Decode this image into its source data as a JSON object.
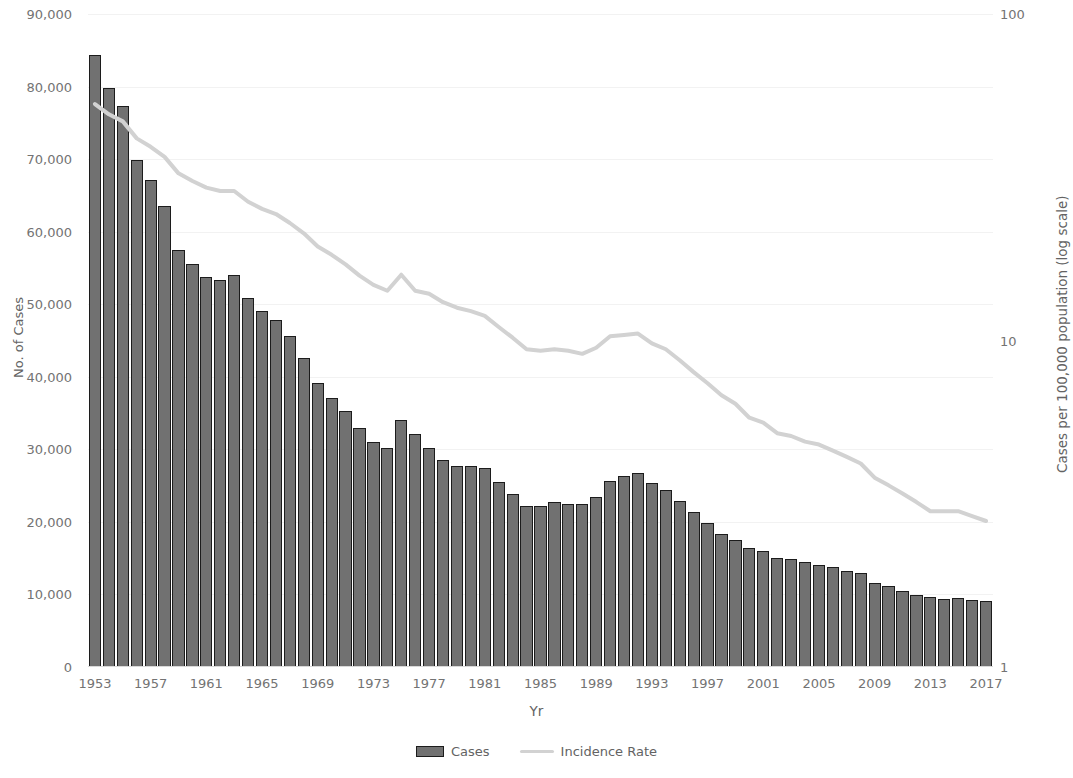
{
  "chart_data": {
    "type": "bar",
    "title": "",
    "xlabel": "Yr",
    "ylabel": "No. of Cases",
    "y2label": "Cases per 100,000 population (log scale)",
    "ylim": [
      0,
      90000
    ],
    "y2lim": [
      1,
      100
    ],
    "y2_scale": "log",
    "grid": true,
    "legend_position": "bottom",
    "y_ticks": [
      "90,000",
      "80,000",
      "70,000",
      "60,000",
      "50,000",
      "40,000",
      "30,000",
      "20,000",
      "10,000",
      "0"
    ],
    "y_tick_values": [
      90000,
      80000,
      70000,
      60000,
      50000,
      40000,
      30000,
      20000,
      10000,
      0
    ],
    "y2_ticks": [
      "100",
      "10",
      "1"
    ],
    "y2_tick_values": [
      100,
      10,
      1
    ],
    "x_tick_labels": [
      "1953",
      "1957",
      "1961",
      "1965",
      "1969",
      "1973",
      "1977",
      "1981",
      "1985",
      "1989",
      "1993",
      "1997",
      "2001",
      "2005",
      "2009",
      "2013",
      "2017"
    ],
    "categories": [
      1953,
      1954,
      1955,
      1956,
      1957,
      1958,
      1959,
      1960,
      1961,
      1962,
      1963,
      1964,
      1965,
      1966,
      1967,
      1968,
      1969,
      1970,
      1971,
      1972,
      1973,
      1974,
      1975,
      1976,
      1977,
      1978,
      1979,
      1980,
      1981,
      1982,
      1983,
      1984,
      1985,
      1986,
      1987,
      1988,
      1989,
      1990,
      1991,
      1992,
      1993,
      1994,
      1995,
      1996,
      1997,
      1998,
      1999,
      2000,
      2001,
      2002,
      2003,
      2004,
      2005,
      2006,
      2007,
      2008,
      2009,
      2010,
      2011,
      2012,
      2013,
      2014,
      2015,
      2016,
      2017
    ],
    "series": [
      {
        "name": "Cases",
        "axis": "left",
        "type": "bar",
        "color": "#717171",
        "values": [
          84304,
          79775,
          77368,
          69895,
          67149,
          63534,
          57535,
          55494,
          53726,
          53315,
          54042,
          50874,
          49016,
          47767,
          45647,
          42623,
          39120,
          37137,
          35217,
          32882,
          30998,
          30122,
          33989,
          32105,
          30145,
          28521,
          27669,
          27749,
          27373,
          25520,
          23846,
          22255,
          22201,
          22768,
          22517,
          22436,
          23495,
          25701,
          26283,
          26673,
          25313,
          24361,
          22860,
          21337,
          19851,
          18361,
          17531,
          16377,
          15989,
          15075,
          14874,
          14517,
          14093,
          13767,
          13299,
          12904,
          11545,
          11182,
          10521,
          9951,
          9582,
          9421,
          9557,
          9272,
          9093
        ]
      },
      {
        "name": "Incidence Rate",
        "axis": "right",
        "type": "line",
        "color": "#d2d2d2",
        "values": [
          53.0,
          49.3,
          46.9,
          41.6,
          39.2,
          36.5,
          32.5,
          30.8,
          29.4,
          28.7,
          28.7,
          26.6,
          25.3,
          24.4,
          22.9,
          21.3,
          19.4,
          18.3,
          17.1,
          15.8,
          14.8,
          14.2,
          15.9,
          14.2,
          13.9,
          13.1,
          12.6,
          12.3,
          11.9,
          11.0,
          10.2,
          9.4,
          9.3,
          9.4,
          9.3,
          9.1,
          9.5,
          10.3,
          10.4,
          10.5,
          9.8,
          9.4,
          8.7,
          8.0,
          7.4,
          6.8,
          6.4,
          5.8,
          5.6,
          5.2,
          5.1,
          4.9,
          4.8,
          4.6,
          4.4,
          4.2,
          3.8,
          3.6,
          3.4,
          3.2,
          3.0,
          3.0,
          3.0,
          2.9,
          2.8
        ]
      }
    ]
  },
  "legend": {
    "items": [
      {
        "label": "Cases",
        "marker": "bar-swatch"
      },
      {
        "label": "Incidence Rate",
        "marker": "line-swatch"
      }
    ]
  },
  "colors": {
    "bar_fill": "#717171",
    "bar_stroke": "#1c1c1c",
    "line": "#d2d2d2",
    "gridline": "#f2f2f2",
    "axis_text": "#737373",
    "background": "#ffffff"
  }
}
